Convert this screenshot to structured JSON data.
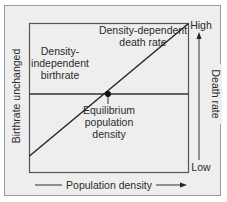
{
  "diagram": {
    "labels": {
      "death_rate_line": [
        "Density-dependent",
        "death rate"
      ],
      "birthrate_line": [
        "Density-",
        "independent",
        "birthrate"
      ],
      "equilibrium": [
        "Equilibrium",
        "population",
        "density"
      ],
      "left_axis": "Birthrate unchanged",
      "right_axis": "Death rate",
      "right_axis_high": "High",
      "right_axis_low": "Low",
      "bottom_axis": "Population density"
    },
    "colors": {
      "background": "#eeeeee",
      "frame": "#555555",
      "line": "#222222",
      "outer_border": "#9a9a9a",
      "text": "#2b2b2b"
    },
    "elements": {
      "death_rate_line": {
        "from": [
          29,
          156
        ],
        "to": [
          188,
          23
        ],
        "trend": "increasing"
      },
      "birthrate_line": {
        "from": [
          29,
          94
        ],
        "to": [
          188,
          94
        ],
        "trend": "constant"
      },
      "equilibrium_point": {
        "x": 108,
        "y": 94
      }
    }
  }
}
